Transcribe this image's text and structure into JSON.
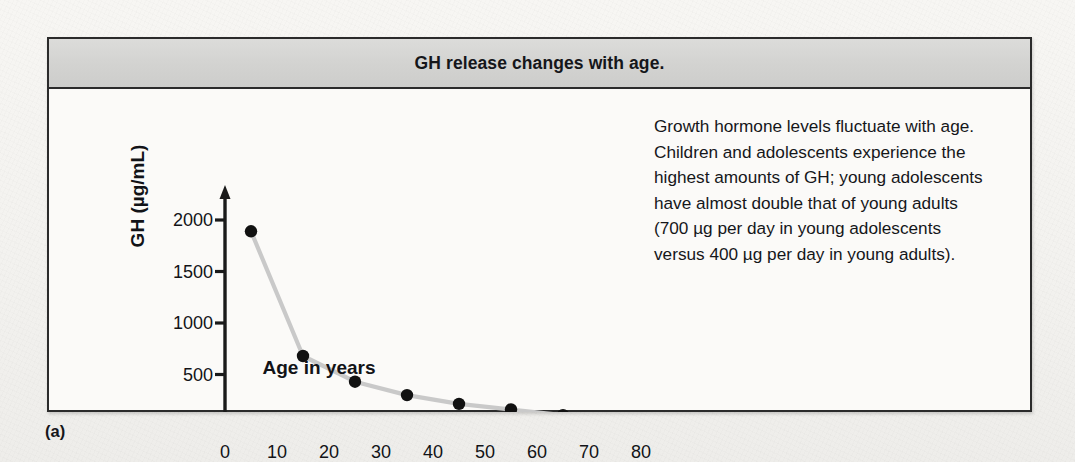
{
  "figure": {
    "title": "GH release changes with age.",
    "panel_label": "(a)",
    "caption": "Growth hormone levels fluctuate with age. Children and adolescents experience the highest amounts of GH; young adolescents have almost double that of young adults (700 µg per day in young adolescents versus 400 µg per day in young adults)."
  },
  "colors": {
    "header_band": "#d3d3d1",
    "border": "#2b2b2b",
    "page": "#f6f5f2",
    "plot_background": "#fbfaf8",
    "marker": "#111111",
    "line": "#c9c9c9",
    "axis": "#1a1a1a"
  },
  "chart_data": {
    "type": "line",
    "title": "GH release changes with age.",
    "xlabel": "Age in years",
    "ylabel": "GH (µg/mL)",
    "xlim": [
      0,
      85
    ],
    "ylim": [
      0,
      2200
    ],
    "grid": false,
    "legend": "none",
    "xticks": [
      0,
      10,
      20,
      30,
      40,
      50,
      60,
      70,
      80
    ],
    "xtick_labels": [
      "0",
      "10",
      "20",
      "30",
      "40",
      "50",
      "60",
      "70",
      "80"
    ],
    "yticks": [
      500,
      1000,
      1500,
      2000
    ],
    "ytick_labels": [
      "500",
      "1000",
      "1500",
      "2000"
    ],
    "marker": "filled-circle",
    "series": [
      {
        "name": "GH level",
        "x": [
          5,
          15,
          25,
          35,
          45,
          55,
          65,
          75
        ],
        "values": [
          1890,
          680,
          430,
          300,
          215,
          160,
          105,
          45
        ]
      }
    ]
  }
}
